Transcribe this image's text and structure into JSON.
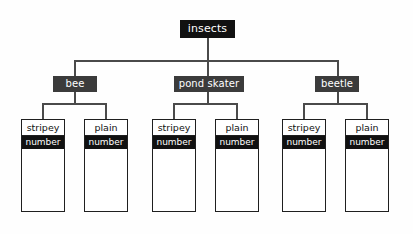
{
  "diagram": {
    "type": "tally-chart-tree",
    "background_color": "#fefefe",
    "line_color": "#4a4a4a",
    "root": {
      "label": "insects",
      "bg_color": "#111111",
      "text_color": "#ffffff"
    },
    "categories": [
      {
        "label": "bee",
        "bg_color": "#3b3b3b",
        "text_color": "#ffffff"
      },
      {
        "label": "pond skater",
        "bg_color": "#3b3b3b",
        "text_color": "#ffffff"
      },
      {
        "label": "beetle",
        "bg_color": "#3b3b3b",
        "text_color": "#ffffff"
      }
    ],
    "leaves": [
      {
        "title": "stripey",
        "subtitle": "number",
        "parent": "bee"
      },
      {
        "title": "plain",
        "subtitle": "number",
        "parent": "bee"
      },
      {
        "title": "stripey",
        "subtitle": "number",
        "parent": "pond skater"
      },
      {
        "title": "plain",
        "subtitle": "number",
        "parent": "pond skater"
      },
      {
        "title": "stripey",
        "subtitle": "number",
        "parent": "beetle"
      },
      {
        "title": "plain",
        "subtitle": "number",
        "parent": "beetle"
      }
    ]
  }
}
